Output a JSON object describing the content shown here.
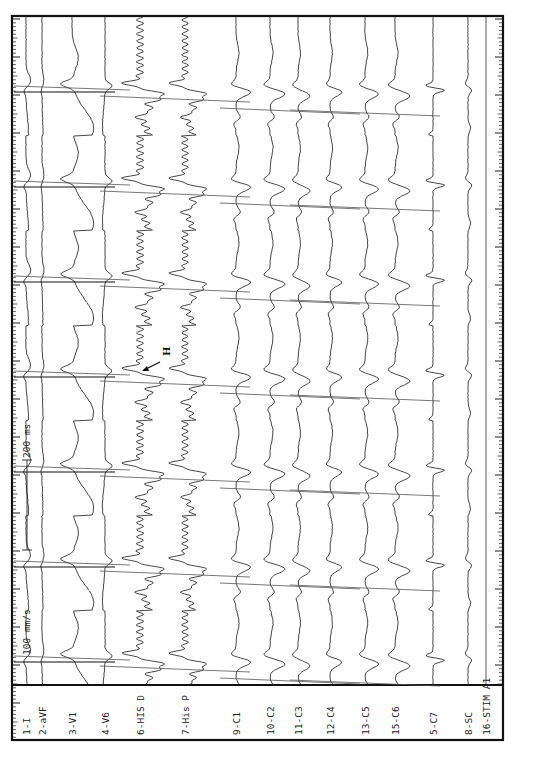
{
  "chart_data": {
    "type": "line",
    "title": "",
    "orientation": "rotated-90 (time runs bottom-to-top, channels are vertical columns)",
    "paper_speed_label": "100 mm/s",
    "calibration_label": "200 ms",
    "annotation": {
      "text": "H",
      "meaning": "His bundle deflection, arrow pointing to 6-HIS D electrogram"
    },
    "beat_positions_px": [
      88,
      183,
      278,
      373,
      468,
      563,
      658
    ],
    "channels": [
      {
        "label": "1-I",
        "x": 26,
        "amp": 5,
        "kind": "surface-flat"
      },
      {
        "label": "2-aVF",
        "x": 42,
        "amp": 2,
        "kind": "surface-flat"
      },
      {
        "label": "3-V1",
        "x": 72,
        "amp": 18,
        "kind": "surface-wide"
      },
      {
        "label": "4-V6",
        "x": 105,
        "amp": 5,
        "kind": "surface-narrow"
      },
      {
        "label": "6-HIS D",
        "x": 140,
        "amp": 18,
        "kind": "his"
      },
      {
        "label": "7-His P",
        "x": 185,
        "amp": 16,
        "kind": "his"
      },
      {
        "label": "9-C1",
        "x": 236,
        "amp": 10,
        "kind": "cs"
      },
      {
        "label": "10-C2",
        "x": 270,
        "amp": 10,
        "kind": "cs"
      },
      {
        "label": "11-C3",
        "x": 298,
        "amp": 8,
        "kind": "cs"
      },
      {
        "label": "12-C4",
        "x": 330,
        "amp": 8,
        "kind": "cs"
      },
      {
        "label": "13-C5",
        "x": 365,
        "amp": 9,
        "kind": "cs"
      },
      {
        "label": "15-C6",
        "x": 395,
        "amp": 10,
        "kind": "cs"
      },
      {
        "label": "5-C7",
        "x": 433,
        "amp": 7,
        "kind": "cs-sharp"
      },
      {
        "label": "8-SC",
        "x": 468,
        "amp": 5,
        "kind": "sc"
      },
      {
        "label": "16-STIM A1",
        "x": 486,
        "amp": 0,
        "kind": "stim"
      }
    ],
    "axis": {
      "x": "channel",
      "y": "time",
      "grid": false,
      "legend": "none"
    }
  },
  "labels_panel": {
    "channels": [
      "1-I",
      "2-aVF",
      "3-V1",
      "4-V6",
      "6-HIS D",
      "7-His P",
      "9-C1",
      "10-C2",
      "11-C3",
      "12-C4",
      "13-C5",
      "15-C6",
      "5-C7",
      "8-SC",
      "16-STIM A1"
    ]
  },
  "annotations": {
    "speed": "100 mm/s",
    "calibration": "200 ms",
    "his_marker": "H"
  },
  "colors": {
    "ink": "#111111",
    "trace": "#333333",
    "paper": "#ffffff"
  }
}
